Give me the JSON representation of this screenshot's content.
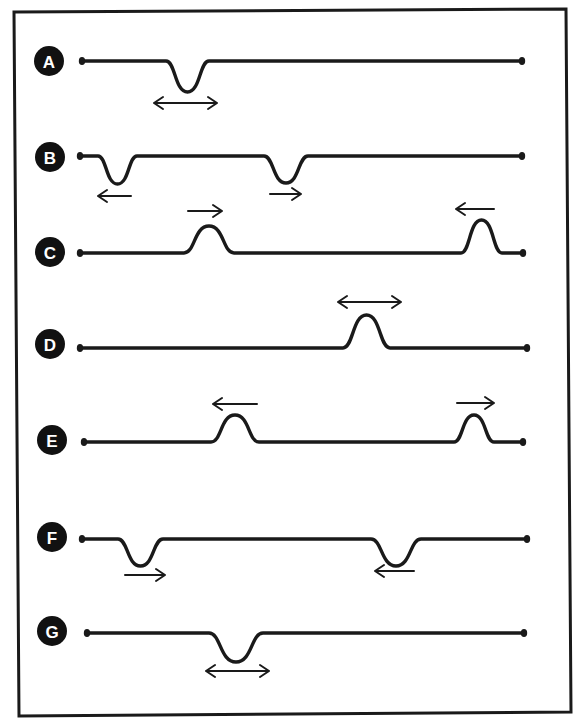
{
  "figure": {
    "colors": {
      "ink": "#1a1a1a",
      "badge": "#111111",
      "badge_text": "#ffffff",
      "background": "#ffffff"
    },
    "frame": {
      "x1": 14,
      "y1": 12,
      "x2": 569,
      "y2": 716
    },
    "rows": [
      {
        "label": "A",
        "badge": {
          "cx": 49,
          "cy": 61
        },
        "line": {
          "x_start": 82,
          "x_end": 522,
          "y": 61
        },
        "features": [
          {
            "type": "dip",
            "x_start": 166,
            "x_end": 209,
            "depth": 31,
            "arrow": "both",
            "arrow_y": 103,
            "arrow_x1": 154,
            "arrow_x2": 217
          }
        ]
      },
      {
        "label": "B",
        "badge": {
          "cx": 50,
          "cy": 157
        },
        "line": {
          "x_start": 80,
          "x_end": 522,
          "y": 156
        },
        "features": [
          {
            "type": "dip",
            "x_start": 98,
            "x_end": 137,
            "depth": 28,
            "arrow": "left",
            "arrow_y": 196,
            "arrow_x1": 98,
            "arrow_x2": 131
          },
          {
            "type": "dip",
            "x_start": 264,
            "x_end": 308,
            "depth": 27,
            "arrow": "right",
            "arrow_y": 194,
            "arrow_x1": 270,
            "arrow_x2": 301
          }
        ]
      },
      {
        "label": "C",
        "badge": {
          "cx": 50,
          "cy": 252
        },
        "line": {
          "x_start": 80,
          "x_end": 523,
          "y": 253
        },
        "features": [
          {
            "type": "bump",
            "x_start": 184,
            "x_end": 234,
            "height": 27,
            "arrow": "right",
            "arrow_y": 211,
            "arrow_x1": 188,
            "arrow_x2": 222
          },
          {
            "type": "bump",
            "x_start": 461,
            "x_end": 502,
            "height": 33,
            "arrow": "left",
            "arrow_y": 209,
            "arrow_x1": 456,
            "arrow_x2": 494
          }
        ]
      },
      {
        "label": "D",
        "badge": {
          "cx": 50,
          "cy": 344
        },
        "line": {
          "x_start": 80,
          "x_end": 527,
          "y": 348
        },
        "features": [
          {
            "type": "bump",
            "x_start": 343,
            "x_end": 390,
            "height": 33,
            "arrow": "both",
            "arrow_y": 302,
            "arrow_x1": 338,
            "arrow_x2": 401
          }
        ]
      },
      {
        "label": "E",
        "badge": {
          "cx": 52,
          "cy": 440
        },
        "line": {
          "x_start": 84,
          "x_end": 523,
          "y": 442
        },
        "features": [
          {
            "type": "bump",
            "x_start": 211,
            "x_end": 259,
            "height": 27,
            "arrow": "left",
            "arrow_y": 404,
            "arrow_x1": 213,
            "arrow_x2": 257
          },
          {
            "type": "bump",
            "x_start": 454,
            "x_end": 494,
            "height": 27,
            "arrow": "right",
            "arrow_y": 403,
            "arrow_x1": 457,
            "arrow_x2": 494
          }
        ]
      },
      {
        "label": "F",
        "badge": {
          "cx": 52,
          "cy": 537
        },
        "line": {
          "x_start": 82,
          "x_end": 527,
          "y": 539
        },
        "features": [
          {
            "type": "dip",
            "x_start": 118,
            "x_end": 163,
            "depth": 27,
            "arrow": "right",
            "arrow_y": 575,
            "arrow_x1": 125,
            "arrow_x2": 165
          },
          {
            "type": "dip",
            "x_start": 371,
            "x_end": 421,
            "depth": 27,
            "arrow": "left",
            "arrow_y": 571,
            "arrow_x1": 375,
            "arrow_x2": 414
          }
        ]
      },
      {
        "label": "G",
        "badge": {
          "cx": 52,
          "cy": 631
        },
        "line": {
          "x_start": 87,
          "x_end": 524,
          "y": 633
        },
        "features": [
          {
            "type": "dip",
            "x_start": 209,
            "x_end": 263,
            "depth": 29,
            "arrow": "both",
            "arrow_y": 671,
            "arrow_x1": 206,
            "arrow_x2": 269
          }
        ]
      }
    ]
  }
}
